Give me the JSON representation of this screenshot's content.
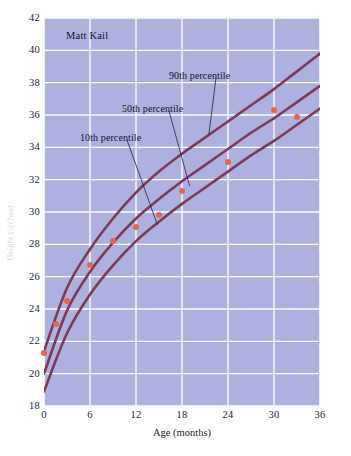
{
  "chart_data": {
    "type": "line",
    "title": "Matt Kail",
    "xlabel": "Age (months)",
    "ylabel": "Height (inches)",
    "xlim": [
      0,
      36
    ],
    "ylim": [
      18,
      42
    ],
    "xticks": [
      0,
      6,
      12,
      18,
      24,
      30,
      36
    ],
    "yticks": [
      18,
      20,
      22,
      24,
      26,
      28,
      30,
      32,
      34,
      36,
      38,
      40,
      42
    ],
    "grid": true,
    "legend_position": "in-plot-annotations",
    "plot_background": "#aeb0e0",
    "curve_color": "#7d3a56",
    "point_color": "#e4674b",
    "gridline_color": "#ffffff",
    "series": [
      {
        "name": "90th percentile",
        "kind": "curve",
        "x": [
          0,
          3,
          6,
          9,
          12,
          15,
          18,
          21,
          24,
          27,
          30,
          33,
          36
        ],
        "values": [
          21.4,
          25.3,
          27.7,
          29.6,
          31.2,
          32.5,
          33.6,
          34.6,
          35.6,
          36.6,
          37.6,
          38.7,
          39.8
        ]
      },
      {
        "name": "50th percentile",
        "kind": "curve",
        "x": [
          0,
          3,
          6,
          9,
          12,
          15,
          18,
          21,
          24,
          27,
          30,
          33,
          36
        ],
        "values": [
          20.0,
          23.9,
          26.3,
          28.1,
          29.6,
          30.8,
          31.9,
          32.9,
          33.9,
          34.9,
          35.8,
          36.8,
          37.8
        ]
      },
      {
        "name": "10th percentile",
        "kind": "curve",
        "x": [
          0,
          3,
          6,
          9,
          12,
          15,
          18,
          21,
          24,
          27,
          30,
          33,
          36
        ],
        "values": [
          18.9,
          22.5,
          24.9,
          26.7,
          28.2,
          29.4,
          30.5,
          31.5,
          32.5,
          33.5,
          34.4,
          35.4,
          36.4
        ]
      },
      {
        "name": "Matt Kail measurements",
        "kind": "points",
        "x": [
          0,
          1.5,
          3,
          6,
          9,
          12,
          15,
          18,
          24,
          30,
          33
        ],
        "values": [
          21.3,
          23.1,
          24.5,
          26.7,
          28.2,
          29.1,
          29.8,
          31.3,
          33.1,
          36.3,
          35.9
        ]
      }
    ],
    "annotations": [
      {
        "text": "90th percentile",
        "target_x": 21.5,
        "target_y": 34.8
      },
      {
        "text": "50th percentile",
        "target_x": 19.0,
        "target_y": 31.6
      },
      {
        "text": "10th percentile",
        "target_x": 14.8,
        "target_y": 29.2
      }
    ]
  }
}
